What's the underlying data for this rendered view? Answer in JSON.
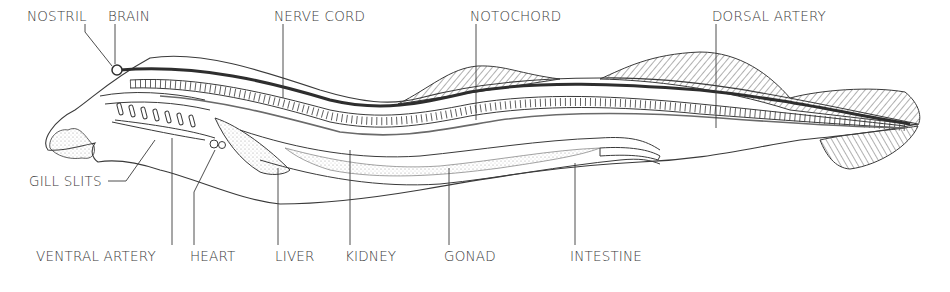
{
  "diagram": {
    "colors": {
      "ink": "#3a3a3a",
      "background": "#ffffff",
      "nerve_cord": "#2e2e2e",
      "stipple": "#9a9a9a"
    },
    "labels": {
      "nostril": "NOSTRIL",
      "brain": "BRAIN",
      "nerve_cord": "NERVE CORD",
      "notochord": "NOTOCHORD",
      "dorsal_artery": "DORSAL ARTERY",
      "gill_slits": "GILL SLITS",
      "ventral_artery": "VENTRAL ARTERY",
      "heart": "HEART",
      "liver": "LIVER",
      "kidney": "KIDNEY",
      "gonad": "GONAD",
      "intestine": "INTESTINE"
    }
  }
}
